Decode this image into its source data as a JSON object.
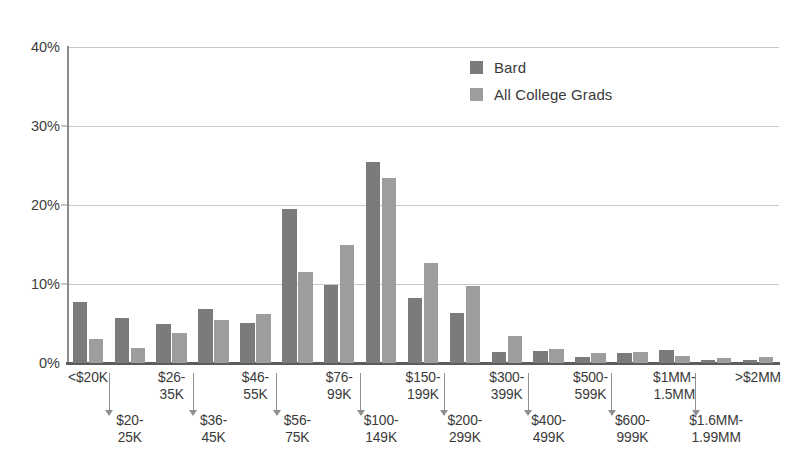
{
  "chart_data": {
    "type": "bar",
    "title": "",
    "subtitle": "",
    "xlabel": "",
    "ylabel": "",
    "ylim": [
      0,
      40
    ],
    "yticks": [
      "0%",
      "10%",
      "20%",
      "30%",
      "40%"
    ],
    "ytick_values": [
      0,
      10,
      20,
      30,
      40
    ],
    "grid": true,
    "legend_position": "top-center-right",
    "categories": [
      "<$20K",
      "$20-\n25K",
      "$26-\n35K",
      "$36-\n45K",
      "$46-\n55K",
      "$56-\n75K",
      "$76-\n99K",
      "$100-\n149K",
      "$150-\n199K",
      "$200-\n299K",
      "$300-\n399K",
      "$400-\n499K",
      "$500-\n599K",
      "$600-\n999K",
      "$1MM-\n1.5MM",
      "$1.6MM-\n1.99MM",
      ">$2MM"
    ],
    "series": [
      {
        "name": "Bard",
        "color": "#7b7b7b",
        "values": [
          7.7,
          5.7,
          4.9,
          6.9,
          5.1,
          19.5,
          9.9,
          25.5,
          8.2,
          6.3,
          1.4,
          1.5,
          0.7,
          1.3,
          1.6,
          0.4,
          0.4
        ]
      },
      {
        "name": "All College Grads",
        "color": "#9d9d9d",
        "values": [
          3.0,
          1.9,
          3.8,
          5.4,
          6.2,
          11.5,
          15.0,
          23.4,
          12.6,
          9.8,
          3.4,
          1.8,
          1.3,
          1.4,
          0.9,
          0.6,
          0.8
        ]
      }
    ]
  },
  "legend": {
    "items": [
      {
        "label": "Bard",
        "color": "#7b7b7b"
      },
      {
        "label": "All College Grads",
        "color": "#9d9d9d"
      }
    ]
  },
  "axis": {
    "y_ticks": [
      "40%",
      "30%",
      "20%",
      "10%",
      "0%"
    ]
  },
  "colors": {
    "series_bard": "#7b7b7b",
    "series_all_college_grads": "#9d9d9d",
    "gridline": "#c8c8c8",
    "axis": "#5c5c5c",
    "text": "#3a3a3a",
    "background": "#ffffff"
  }
}
